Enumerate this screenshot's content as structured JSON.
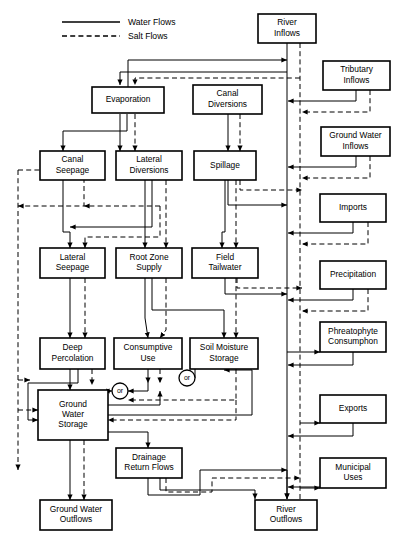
{
  "legend": {
    "items": [
      {
        "label": "Water Flows",
        "style": "solid",
        "x": 62,
        "y": 22,
        "x2": 120
      },
      {
        "label": "Salt Flows",
        "style": "dashed",
        "x": 62,
        "y": 36,
        "x2": 120
      }
    ],
    "label_x": 128
  },
  "nodes": [
    {
      "id": "river-inflows",
      "label": "River\nInflows",
      "x": 258,
      "y": 14,
      "w": 58,
      "h": 29
    },
    {
      "id": "tributary-inflows",
      "label": "Tributary\nInflows",
      "x": 323,
      "y": 61,
      "w": 67,
      "h": 29
    },
    {
      "id": "evaporation",
      "label": "Evaporation",
      "x": 92,
      "y": 87,
      "w": 72,
      "h": 26
    },
    {
      "id": "canal-diversions",
      "label": "Canal\nDiversions",
      "x": 193,
      "y": 85,
      "w": 69,
      "h": 29
    },
    {
      "id": "ground-water-inflows",
      "label": "Ground Water\nInflows",
      "x": 321,
      "y": 127,
      "w": 69,
      "h": 29
    },
    {
      "id": "canal-seepage",
      "label": "Canal\nSeepage",
      "x": 40,
      "y": 151,
      "w": 65,
      "h": 29
    },
    {
      "id": "lateral-diversions",
      "label": "Lateral\nDiversions",
      "x": 116,
      "y": 151,
      "w": 66,
      "h": 29
    },
    {
      "id": "spillage",
      "label": "Spillage",
      "x": 194,
      "y": 151,
      "w": 62,
      "h": 29
    },
    {
      "id": "imports",
      "label": "Imports",
      "x": 320,
      "y": 194,
      "w": 66,
      "h": 28
    },
    {
      "id": "lateral-seepage",
      "label": "Lateral\nSeepage",
      "x": 40,
      "y": 248,
      "w": 65,
      "h": 30
    },
    {
      "id": "root-zone-supply",
      "label": "Root  Zone\nSupply",
      "x": 116,
      "y": 248,
      "w": 66,
      "h": 30
    },
    {
      "id": "field-tailwater",
      "label": "Field\nTailwater",
      "x": 192,
      "y": 248,
      "w": 66,
      "h": 30
    },
    {
      "id": "precipitation",
      "label": "Precipitation",
      "x": 320,
      "y": 261,
      "w": 66,
      "h": 28
    },
    {
      "id": "deep-percolation",
      "label": "Deep\nPercolation",
      "x": 40,
      "y": 338,
      "w": 65,
      "h": 31
    },
    {
      "id": "consumptive-use",
      "label": "Consumptive\nUse",
      "x": 114,
      "y": 338,
      "w": 68,
      "h": 31
    },
    {
      "id": "soil-moisture-storage",
      "label": "Soil Moisture\nStorage",
      "x": 190,
      "y": 338,
      "w": 68,
      "h": 31
    },
    {
      "id": "phreatophyte",
      "label": "Phreatophyte\nConsumphon",
      "x": 320,
      "y": 322,
      "w": 66,
      "h": 30
    },
    {
      "id": "ground-water-storage",
      "label": "Ground\nWater\nStorage",
      "x": 38,
      "y": 390,
      "w": 70,
      "h": 50
    },
    {
      "id": "exports",
      "label": "Exports",
      "x": 320,
      "y": 395,
      "w": 66,
      "h": 28
    },
    {
      "id": "drainage-return",
      "label": "Drainage\nReturn Flows",
      "x": 116,
      "y": 448,
      "w": 66,
      "h": 30
    },
    {
      "id": "municipal-uses",
      "label": "Municipal\nUses",
      "x": 320,
      "y": 458,
      "w": 66,
      "h": 30
    },
    {
      "id": "ground-water-outflows",
      "label": "Ground Water\nOutflows",
      "x": 40,
      "y": 500,
      "w": 72,
      "h": 30
    },
    {
      "id": "river-outflows",
      "label": "River\nOutflows",
      "x": 255,
      "y": 500,
      "w": 62,
      "h": 30
    }
  ],
  "or_nodes": [
    {
      "id": "or-left",
      "label": "or",
      "cx": 120,
      "cy": 391,
      "r": 8
    },
    {
      "id": "or-right",
      "label": "or",
      "cx": 187,
      "cy": 378,
      "r": 8
    }
  ],
  "water_paths": [
    "M287,43 L287,125 L287,220 L287,300 L287,360 L287,430 L287,487 L287,499",
    "M287,72 L120,72 L120,85",
    "M120,114 L120,151",
    "M127,114 L127,131 L63,131 L63,151",
    "M356,90 L356,101 L288,101",
    "M356,156 L356,167 L288,167",
    "M353,222 L353,233 L288,233",
    "M353,289 L353,300 L288,300",
    "M228,114 L228,151",
    "M63,180 L63,232 L70,232 L70,248",
    "M145,180 L145,232 L145,248",
    "M152,180 L152,227 L70,227",
    "M225,180 L225,232 L222,232 L222,248",
    "M228,180 L228,205 L287,205",
    "M225,278 L225,294 L287,294",
    "M70,278 L70,318 L70,338",
    "M145,278 L145,318 L148,338",
    "M152,278 L152,310 L224,310 L224,338",
    "M70,369 L70,390",
    "M78,369 L78,383 L28,383 L28,420 L38,420",
    "M148,369 L148,383",
    "M148,383 L148,391 L128,391",
    "M162,369 L162,362 L179,362",
    "M195,378 L195,362 L218,362 L218,369",
    "M108,405 L160,405 L160,391",
    "M108,415 L252,415 L252,370 L224,370",
    "M108,432 L148,432 L148,448",
    "M70,440 L70,500",
    "M148,478 L148,495 L200,495 L200,470 L287,470",
    "M160,478 L160,490 L255,490 L255,499",
    "M287,470 L287,499",
    "M287,352 L320,352",
    "M300,423 L320,423",
    "M300,488 L320,488",
    "M353,352 L353,365 L288,365",
    "M353,423 L353,436 L288,436",
    "M353,488 L353,487 L288,487",
    "M128,87 L128,60 L287,60"
  ],
  "salt_paths": [
    "M300,43 L300,125 L300,220 L300,300 L300,360 L300,430 L300,490 L300,530",
    "M300,78 L135,78 L135,85",
    "M135,114 L135,151",
    "M370,90 L370,112 L302,112",
    "M370,156 L370,178 L302,178",
    "M368,222 L368,244 L302,244",
    "M368,289 L368,311 L302,311",
    "M240,114 L240,151",
    "M240,180 L240,190 L302,190",
    "M237,278 L237,288 L302,288",
    "M18,170 L18,380 L18,470",
    "M18,170 L84,170 L84,206 L18,206",
    "M160,206 L84,206",
    "M160,206 L160,237 L85,237 L85,248",
    "M166,180 L166,240 L166,248",
    "M236,180 L236,240 L236,248",
    "M85,278 L85,330 L85,338",
    "M166,278 L166,330 L160,338",
    "M236,278 L236,322 L236,338",
    "M92,369 L92,385",
    "M160,369 L160,383",
    "M236,369 L236,400 L140,400 L128,400",
    "M112,391 L112,391",
    "M18,410 L38,410",
    "M84,440 L84,500",
    "M166,478 L166,492 L212,492 L212,478 L300,478",
    "M112,391 L104,391",
    "M236,400 L236,420 L108,420",
    "M18,380 L30,380"
  ]
}
